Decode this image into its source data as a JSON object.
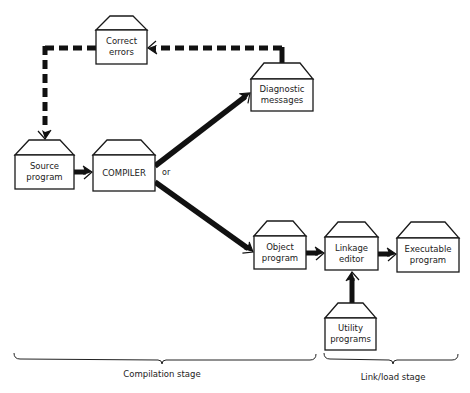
{
  "diagram": {
    "type": "flowchart",
    "nodes": [
      {
        "id": "correct",
        "lines": [
          "Correct",
          "errors"
        ],
        "x": 96,
        "y": 30,
        "w": 51,
        "h": 34,
        "roof_top": 16,
        "roof_inset": 14
      },
      {
        "id": "diagnostic",
        "lines": [
          "Diagnostic",
          "messages"
        ],
        "x": 251,
        "y": 79,
        "w": 62,
        "h": 32,
        "roof_top": 63,
        "roof_inset": 13
      },
      {
        "id": "source",
        "lines": [
          "Source",
          "program"
        ],
        "x": 15,
        "y": 155,
        "w": 59,
        "h": 34,
        "roof_top": 140,
        "roof_inset": 14
      },
      {
        "id": "compiler",
        "lines": [
          "COMPILER"
        ],
        "x": 93,
        "y": 155,
        "w": 62,
        "h": 36,
        "roof_top": 140,
        "roof_inset": 14
      },
      {
        "id": "object",
        "lines": [
          "Object",
          "program"
        ],
        "x": 254,
        "y": 236,
        "w": 52,
        "h": 33,
        "roof_top": 221,
        "roof_inset": 13
      },
      {
        "id": "linkage",
        "lines": [
          "Linkage",
          "editor"
        ],
        "x": 325,
        "y": 237,
        "w": 53,
        "h": 33,
        "roof_top": 222,
        "roof_inset": 13
      },
      {
        "id": "executable",
        "lines": [
          "Executable",
          "program"
        ],
        "x": 397,
        "y": 238,
        "w": 62,
        "h": 34,
        "roof_top": 222,
        "roof_inset": 14
      },
      {
        "id": "utility",
        "lines": [
          "Utility",
          "programs"
        ],
        "x": 325,
        "y": 318,
        "w": 51,
        "h": 32,
        "roof_top": 303,
        "roof_inset": 13
      }
    ],
    "edges": [
      {
        "from": "source",
        "to": "compiler",
        "style": "solid"
      },
      {
        "from": "compiler",
        "to": "diagnostic",
        "style": "solid"
      },
      {
        "from": "compiler",
        "to": "object",
        "style": "solid"
      },
      {
        "from": "object",
        "to": "linkage",
        "style": "solid"
      },
      {
        "from": "linkage",
        "to": "executable",
        "style": "solid"
      },
      {
        "from": "utility",
        "to": "linkage",
        "style": "solid"
      },
      {
        "from": "diagnostic",
        "to": "correct",
        "style": "dashed"
      },
      {
        "from": "correct",
        "to": "source",
        "style": "dashed"
      }
    ],
    "or_label": "or",
    "stages": [
      {
        "label": "Compilation stage",
        "x1": 14,
        "x2": 316,
        "tip": 162
      },
      {
        "label": "Link/load stage",
        "x1": 324,
        "x2": 458,
        "tip": 393
      }
    ]
  }
}
